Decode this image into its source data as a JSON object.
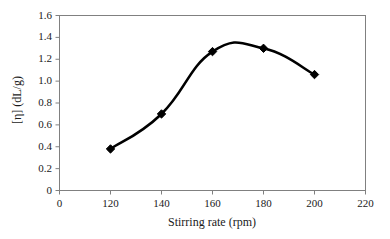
{
  "chart_data": {
    "type": "line",
    "title": "",
    "subtitle": "",
    "xlabel": "Stirring rate (rpm)",
    "ylabel": "[η] (dL/g)",
    "x": [
      120,
      140,
      160,
      180,
      200
    ],
    "values": [
      0.38,
      0.7,
      1.27,
      1.3,
      1.06
    ],
    "series": [
      {
        "name": "[η] (dL/g)",
        "x": [
          120,
          140,
          160,
          180,
          200
        ],
        "values": [
          0.38,
          0.7,
          1.27,
          1.3,
          1.06
        ]
      }
    ],
    "xticks": [
      "0",
      "120",
      "140",
      "160",
      "180",
      "200",
      "220"
    ],
    "xtick_values": [
      0,
      120,
      140,
      160,
      180,
      200,
      220
    ],
    "yticks": [
      "0",
      "0.2",
      "0.4",
      "0.6",
      "0.8",
      "1.0",
      "1.2",
      "1.4",
      "1.6"
    ],
    "ytick_values": [
      0,
      0.2,
      0.4,
      0.6,
      0.8,
      1.0,
      1.2,
      1.4,
      1.6
    ],
    "ylim": [
      0,
      1.6
    ],
    "grid": false,
    "legend": false,
    "legend_position": "none",
    "marker": "diamond",
    "marker_color": "#000000",
    "line_color": "#000000",
    "axis_color": "#808080",
    "background_color": "#ffffff",
    "smoothing": "spline",
    "peak_value": 1.34,
    "peak_x": 170,
    "annotations": []
  }
}
